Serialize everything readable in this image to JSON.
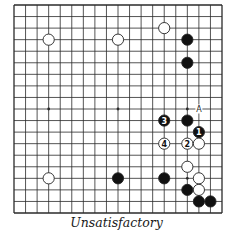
{
  "diagram": {
    "type": "go-board",
    "size": 19,
    "caption": "Unsatisfactory",
    "colors": {
      "background": "#ffffff",
      "grid": "#2a2a2a",
      "black_stone": "#111111",
      "white_stone": "#ffffff",
      "stone_outline": "#222222"
    },
    "star_points": [
      [
        3,
        3
      ],
      [
        9,
        3
      ],
      [
        15,
        3
      ],
      [
        3,
        9
      ],
      [
        9,
        9
      ],
      [
        15,
        9
      ],
      [
        3,
        15
      ],
      [
        9,
        15
      ],
      [
        15,
        15
      ]
    ],
    "stones": [
      {
        "color": "white",
        "col": 3,
        "row": 3,
        "label": ""
      },
      {
        "color": "white",
        "col": 9,
        "row": 3,
        "label": ""
      },
      {
        "color": "white",
        "col": 13,
        "row": 2,
        "label": ""
      },
      {
        "color": "black",
        "col": 15,
        "row": 3,
        "label": ""
      },
      {
        "color": "black",
        "col": 15,
        "row": 5,
        "label": ""
      },
      {
        "color": "black",
        "col": 13,
        "row": 10,
        "label": "3"
      },
      {
        "color": "black",
        "col": 15,
        "row": 10,
        "label": ""
      },
      {
        "color": "black",
        "col": 16,
        "row": 11,
        "label": "1"
      },
      {
        "color": "white",
        "col": 13,
        "row": 12,
        "label": "4"
      },
      {
        "color": "white",
        "col": 15,
        "row": 12,
        "label": "2"
      },
      {
        "color": "white",
        "col": 16,
        "row": 12,
        "label": ""
      },
      {
        "color": "white",
        "col": 15,
        "row": 14,
        "label": ""
      },
      {
        "color": "white",
        "col": 3,
        "row": 15,
        "label": ""
      },
      {
        "color": "black",
        "col": 9,
        "row": 15,
        "label": ""
      },
      {
        "color": "black",
        "col": 13,
        "row": 15,
        "label": ""
      },
      {
        "color": "white",
        "col": 16,
        "row": 15,
        "label": ""
      },
      {
        "color": "black",
        "col": 15,
        "row": 16,
        "label": ""
      },
      {
        "color": "white",
        "col": 16,
        "row": 16,
        "label": ""
      },
      {
        "color": "black",
        "col": 16,
        "row": 17,
        "label": ""
      },
      {
        "color": "black",
        "col": 17,
        "row": 17,
        "label": ""
      }
    ],
    "point_labels": [
      {
        "col": 16,
        "row": 9,
        "text": "A"
      }
    ]
  }
}
